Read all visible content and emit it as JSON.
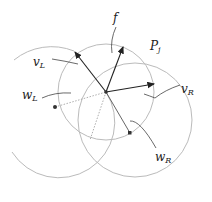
{
  "labels": {
    "f": "f",
    "vL": "v",
    "vL_sub": "L",
    "vR": "v",
    "vR_sub": "R",
    "wL": "w",
    "wL_sub": "L",
    "wR": "w",
    "wR_sub": "R",
    "Pj": "P",
    "Pj_sub": "j"
  },
  "colors": {
    "circle": "#b8b8b8",
    "arrow": "#333333",
    "leader": "#444444"
  }
}
